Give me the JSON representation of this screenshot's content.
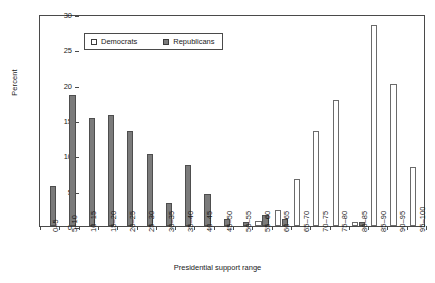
{
  "chart_data": {
    "type": "bar",
    "title": "",
    "xlabel": "Presidential support range",
    "ylabel": "Percent",
    "ylim": [
      0,
      30
    ],
    "ytick_values": [
      0,
      5,
      10,
      15,
      20,
      25,
      30
    ],
    "ytick_labels": [
      "0",
      "5",
      "10",
      "15",
      "20",
      "25",
      "30"
    ],
    "grid": false,
    "legend_position": "top-left (inside axes)",
    "categories": [
      "0–5",
      "5–10",
      "10–15",
      "15–20",
      "20–25",
      "25–30",
      "30–35",
      "35–40",
      "40–45",
      "45–50",
      "50–55",
      "55–60",
      "60–65",
      "65–70",
      "70–75",
      "75–80",
      "80–85",
      "85–90",
      "90–95",
      "95–100"
    ],
    "series": [
      {
        "name": "Democrats",
        "color": "#ffffff",
        "edge_color": "#6b6b6b",
        "values": [
          0,
          0,
          0,
          0,
          0,
          0,
          0,
          0,
          0,
          0,
          0,
          0.7,
          2.2,
          6.6,
          13.4,
          17.9,
          0.5,
          28.4,
          20.1,
          8.3
        ]
      },
      {
        "name": "Republicans",
        "color": "#7b7b7b",
        "edge_color": "#4e4e4e",
        "values": [
          5.6,
          18.5,
          15.3,
          15.7,
          13.4,
          10.2,
          3.2,
          8.7,
          4.6,
          1.0,
          0.5,
          1.6,
          1.0,
          0,
          0,
          0,
          0.6,
          0,
          0,
          0
        ]
      }
    ]
  },
  "legend": {
    "items": [
      {
        "label": "Democrats",
        "key": "dem"
      },
      {
        "label": "Republicans",
        "key": "rep"
      }
    ]
  }
}
